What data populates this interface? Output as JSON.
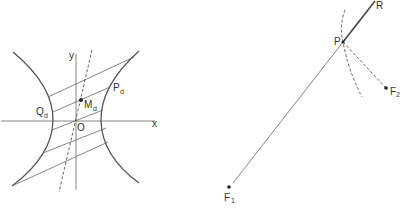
{
  "left_figure": {
    "axis_labels": {
      "x": "x",
      "y": "y"
    },
    "origin_label": "O",
    "points": {
      "Q": {
        "main": "Q",
        "sub": "d"
      },
      "M": {
        "main": "M",
        "sub": "d"
      },
      "P": {
        "main": "P",
        "sub": "d"
      }
    },
    "colors": {
      "stroke": "#555555",
      "text": "#333333"
    }
  },
  "right_figure": {
    "points": {
      "P": {
        "main": "P"
      },
      "R": {
        "main": "R"
      },
      "F1": {
        "main": "F",
        "sub": "1"
      },
      "F2": {
        "main": "F",
        "sub": "2"
      }
    },
    "colors": {
      "stroke": "#555555",
      "text": "#333333"
    }
  }
}
